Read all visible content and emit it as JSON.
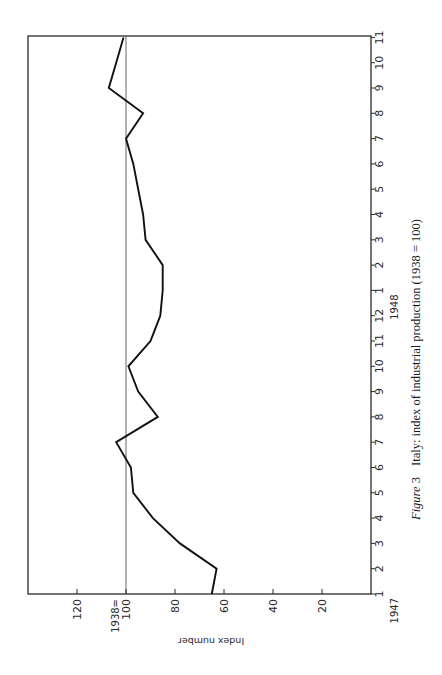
{
  "figure": {
    "label": "Figure",
    "number": "3",
    "title": "Italy: index of industrial production (1938 = 100)"
  },
  "axes": {
    "y_title": "Index number",
    "y_ticks": [
      {
        "value": 120,
        "label": "120"
      },
      {
        "value": 100,
        "label": "100",
        "prefix": "1938="
      },
      {
        "value": 80,
        "label": "80"
      },
      {
        "value": 60,
        "label": "60"
      },
      {
        "value": 40,
        "label": "40"
      },
      {
        "value": 20,
        "label": "20"
      }
    ],
    "x_year_labels": [
      {
        "index": 0,
        "label": "1947"
      },
      {
        "index": 12,
        "label": "1948"
      }
    ],
    "x_month_labels": [
      "1",
      "2",
      "3",
      "4",
      "5",
      "6",
      "7",
      "8",
      "9",
      "10",
      "11",
      "12",
      "1",
      "2",
      "3",
      "4",
      "5",
      "6",
      "7",
      "8",
      "9",
      "10",
      "11"
    ]
  },
  "chart_data": {
    "type": "line",
    "title": "Italy: index of industrial production (1938 = 100)",
    "xlabel": "Month (1947–1948)",
    "ylabel": "Index number",
    "ylim": [
      0,
      140
    ],
    "reference_line": {
      "value": 100,
      "label": "1938=100"
    },
    "grid": false,
    "orientation": "rotated 90° counter-clockwise on page",
    "x": [
      "1947-01",
      "1947-02",
      "1947-03",
      "1947-04",
      "1947-05",
      "1947-06",
      "1947-07",
      "1947-08",
      "1947-09",
      "1947-10",
      "1947-11",
      "1947-12",
      "1948-01",
      "1948-02",
      "1948-03",
      "1948-04",
      "1948-05",
      "1948-06",
      "1948-07",
      "1948-08",
      "1948-09",
      "1948-10",
      "1948-11"
    ],
    "series": [
      {
        "name": "Index of industrial production",
        "values": [
          65,
          63,
          78,
          89,
          97,
          98,
          104,
          87,
          95,
          99,
          90,
          86,
          85,
          85,
          92,
          93,
          95,
          97,
          100,
          93,
          107,
          104,
          101
        ]
      }
    ]
  }
}
